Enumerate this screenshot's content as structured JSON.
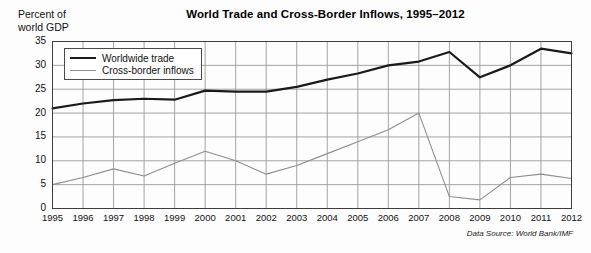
{
  "header": {
    "title": "World Trade and Cross-Border Inflows, 1995–2012",
    "y_axis_caption": "Percent of\nworld GDP"
  },
  "legend": {
    "position": "inside-top-left",
    "entries": [
      {
        "label": "Worldwide trade",
        "color": "#1a1a1a",
        "style": "thick-solid"
      },
      {
        "label": "Cross-border inflows",
        "color": "#8e8e8e",
        "style": "thin-solid"
      }
    ]
  },
  "footer": {
    "data_source": "Data Source: World Bank/IMF"
  },
  "colors": {
    "trade_line": "#1a1a1a",
    "inflow_line": "#8e8e8e",
    "grid": "#9a9a9a",
    "frame": "#3d3d3d",
    "background": "#fdfdfd"
  },
  "chart_data": {
    "type": "line",
    "title": "World Trade and Cross-Border Inflows, 1995–2012",
    "subtitle": "",
    "xlabel": "",
    "ylabel": "Percent of world GDP",
    "xlim": [
      1995,
      2012
    ],
    "ylim": [
      0,
      35
    ],
    "ytick_step": 5,
    "grid": true,
    "legend_position": "upper left (inside plot)",
    "annotations": [
      "Data Source: World Bank/IMF"
    ],
    "categories": [
      1995,
      1996,
      1997,
      1998,
      1999,
      2000,
      2001,
      2002,
      2003,
      2004,
      2005,
      2006,
      2007,
      2008,
      2009,
      2010,
      2011,
      2012
    ],
    "x": [
      "1995",
      "1996",
      "1997",
      "1998",
      "1999",
      "2000",
      "2001",
      "2002",
      "2003",
      "2004",
      "2005",
      "2006",
      "2007",
      "2008",
      "2009",
      "2010",
      "2011",
      "2012"
    ],
    "yticks": [
      "0",
      "5",
      "10",
      "15",
      "20",
      "25",
      "30",
      "35"
    ],
    "series": [
      {
        "name": "Worldwide trade",
        "color": "#1a1a1a",
        "values": [
          21.0,
          22.0,
          22.7,
          23.0,
          22.8,
          24.7,
          24.5,
          24.5,
          25.5,
          27.0,
          28.3,
          30.0,
          30.8,
          32.8,
          27.5,
          30.0,
          33.5,
          32.5
        ]
      },
      {
        "name": "Cross-border inflows",
        "color": "#8e8e8e",
        "values": [
          5.0,
          6.5,
          8.3,
          6.8,
          9.5,
          12.0,
          10.0,
          7.2,
          9.0,
          11.5,
          14.0,
          16.5,
          20.0,
          2.5,
          1.8,
          6.5,
          7.2,
          6.3
        ]
      }
    ]
  }
}
